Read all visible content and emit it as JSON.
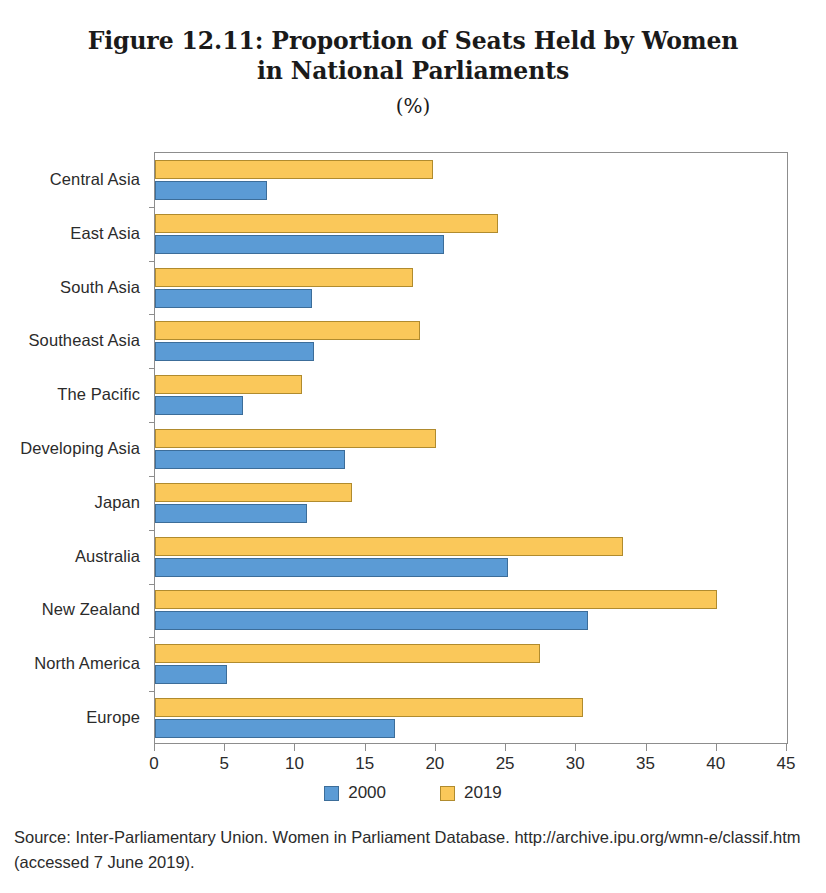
{
  "figure": {
    "title_line1": "Figure 12.11: Proportion of Seats Held by Women",
    "title_line2": "in National Parliaments",
    "unit": "(%)",
    "source": "Source: Inter-Parliamentary Union. Women in Parliament Database. http://archive.ipu.org/wmn-e/classif.htm (accessed 7 June 2019)."
  },
  "legend": {
    "items": [
      {
        "label": "2000",
        "color": "#5b9bd5"
      },
      {
        "label": "2019",
        "color": "#fac85a"
      }
    ]
  },
  "axis": {
    "ticks": [
      "0",
      "5",
      "10",
      "15",
      "20",
      "25",
      "30",
      "35",
      "40",
      "45"
    ]
  },
  "chart_data": {
    "type": "bar",
    "orientation": "horizontal",
    "title": "Figure 12.11: Proportion of Seats Held by Women in National Parliaments (%)",
    "xlabel": "(%)",
    "ylabel": "",
    "xlim": [
      0,
      45
    ],
    "xticks": [
      0,
      5,
      10,
      15,
      20,
      25,
      30,
      35,
      40,
      45
    ],
    "grid": false,
    "legend_position": "bottom",
    "categories": [
      "Central Asia",
      "East Asia",
      "South Asia",
      "Southeast Asia",
      "The Pacific",
      "Developing Asia",
      "Japan",
      "Australia",
      "New Zealand",
      "North America",
      "Europe"
    ],
    "series": [
      {
        "name": "2000",
        "color": "#5b9bd5",
        "values": [
          8.0,
          20.6,
          11.2,
          11.3,
          6.3,
          13.5,
          10.8,
          25.1,
          30.8,
          5.1,
          17.1
        ]
      },
      {
        "name": "2019",
        "color": "#fac85a",
        "values": [
          19.8,
          24.4,
          18.4,
          18.9,
          10.5,
          20.0,
          14.0,
          33.3,
          40.0,
          27.4,
          30.5
        ]
      }
    ]
  }
}
